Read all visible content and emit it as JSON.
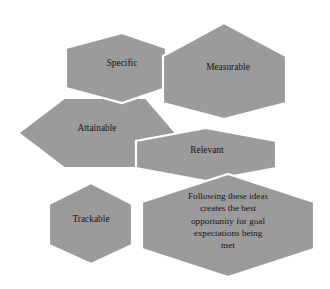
{
  "diagram": {
    "shape": "hexagon",
    "fill_color": "#9b9b9b",
    "outline_color": "#ffffff",
    "text_color": "#161616",
    "background_color": "#ffffff",
    "nodes": [
      {
        "id": "specific",
        "label": "Specific",
        "lines": [
          "Specific"
        ]
      },
      {
        "id": "measurable",
        "label": "Measurable",
        "lines": [
          "Measurable"
        ]
      },
      {
        "id": "attainable",
        "label": "Attainable",
        "lines": [
          "Attainable"
        ]
      },
      {
        "id": "relevant",
        "label": "Relevant",
        "lines": [
          "Relevant"
        ]
      },
      {
        "id": "trackable",
        "label": "Trackable",
        "lines": [
          "Trackable"
        ]
      },
      {
        "id": "summary",
        "label": "Following these ideas creates the best opportunity for goal expectations being met",
        "lines": [
          "Following these ideas",
          "creates the best",
          "opportunity for goal",
          "expectations being",
          "met"
        ]
      }
    ]
  }
}
